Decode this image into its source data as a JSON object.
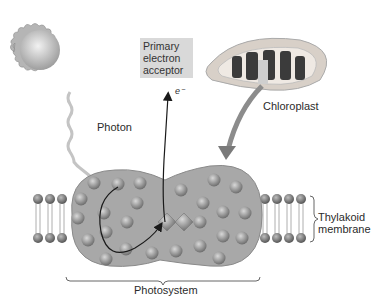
{
  "figure": {
    "labels": {
      "primary_acceptor": [
        "Primary",
        "electron",
        "acceptor"
      ],
      "electron": "e⁻",
      "photon": "Photon",
      "chloroplast": "Chloroplast",
      "thylakoid": [
        "Thylakoid",
        "membrane"
      ],
      "photosystem": "Photosystem"
    },
    "colors": {
      "background": "#ffffff",
      "photosystem_fill": "#a6a6a6",
      "pigment_ball": "#8c8c8c",
      "acceptor_box": "#d9d9d9",
      "sun": "#c8c8c8",
      "membrane_head": "#7a7a7a",
      "arrow": "#1a1a1a"
    }
  }
}
